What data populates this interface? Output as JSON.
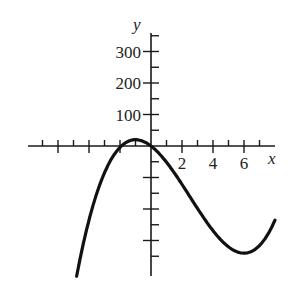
{
  "chart_data": {
    "type": "line",
    "title": "",
    "xlabel": "x",
    "ylabel": "y",
    "xlim": [
      -8,
      8
    ],
    "ylim": [
      -400,
      350
    ],
    "x_ticks_minor": [
      -7,
      -6,
      -5,
      -4,
      -3,
      -2,
      -1,
      1,
      2,
      3,
      4,
      5,
      6,
      7
    ],
    "x_ticks_major": [
      -6,
      -4,
      -2,
      2,
      4,
      6
    ],
    "x_tick_labels": [
      {
        "value": 2,
        "text": "2"
      },
      {
        "value": 4,
        "text": "4"
      },
      {
        "value": 6,
        "text": "6"
      }
    ],
    "y_ticks_minor": [
      -350,
      -250,
      -150,
      -50,
      50,
      150,
      250,
      350
    ],
    "y_ticks_major": [
      -300,
      -200,
      -100,
      100,
      200,
      300
    ],
    "y_tick_labels": [
      {
        "value": 100,
        "text": "100"
      },
      {
        "value": 200,
        "text": "200"
      },
      {
        "value": 300,
        "text": "300"
      }
    ],
    "grid": false,
    "series": [
      {
        "name": "f(x)",
        "description": "cubic with local max near x=-1 (y≈20) and local min near x=6 (y≈-340); roots near x=-2 and x=0",
        "x": [
          -4.8,
          -4,
          -3,
          -2,
          -1,
          0,
          1,
          2,
          3,
          4,
          5,
          6,
          7,
          8
        ],
        "y": [
          -414,
          -252,
          -104,
          -4,
          20,
          0,
          -51,
          -122,
          -189,
          -240,
          -263,
          -340,
          -320,
          -235
        ]
      }
    ]
  }
}
